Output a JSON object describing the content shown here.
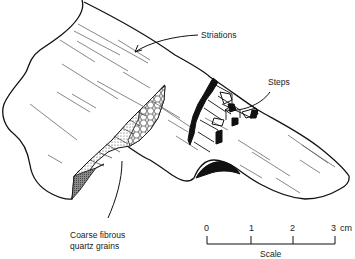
{
  "figure": {
    "type": "line-drawing",
    "labels": {
      "striations": "Striations",
      "steps": "Steps",
      "quartz_line1": "Coarse fibrous",
      "quartz_line2": "quartz grains"
    },
    "scale": {
      "title": "Scale",
      "ticks": [
        "0",
        "1",
        "2",
        "3"
      ],
      "unit": "cm"
    }
  }
}
